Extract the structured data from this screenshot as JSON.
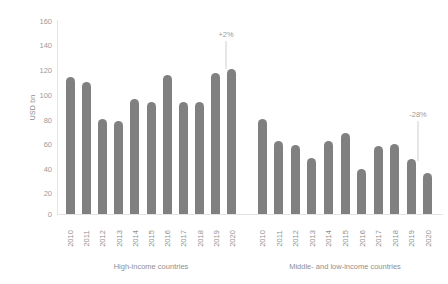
{
  "chart_data": {
    "type": "bar",
    "title": "",
    "xlabel": "",
    "ylabel": "USD bn",
    "ylim": [
      0,
      160
    ],
    "ytick_step": 20,
    "yticks": [
      "160",
      "140",
      "120",
      "100",
      "80",
      "60",
      "40",
      "20",
      "0"
    ],
    "grid": false,
    "legend": "none",
    "bar_color": "#808080",
    "categories": [
      "2010",
      "2011",
      "2012",
      "2013",
      "2014",
      "2015",
      "2016",
      "2017",
      "2018",
      "2019",
      "2020"
    ],
    "groups": [
      {
        "name": "High-income countries",
        "values": [
          113,
          109,
          78,
          77,
          95,
          92,
          115,
          92,
          92,
          116,
          120
        ],
        "annotation": {
          "text": "+2%"
        }
      },
      {
        "name": "Middle- and low-income countries",
        "values": [
          78,
          60,
          57,
          46,
          60,
          67,
          37,
          56,
          58,
          45,
          34
        ],
        "annotation": {
          "text": "-28%"
        }
      }
    ]
  }
}
